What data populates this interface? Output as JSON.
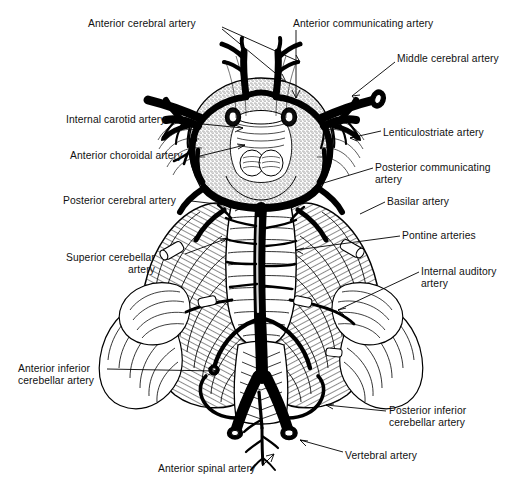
{
  "figure": {
    "background_color": "#ffffff",
    "ink_color": "#000000",
    "style": "black-and-white line engraving / stipple anatomical illustration"
  },
  "labels": [
    {
      "id": "anterior-cerebral-artery",
      "text": "Anterior cerebral artery",
      "text2": "",
      "x": 88,
      "y": 18,
      "align": "left"
    },
    {
      "id": "anterior-communicating-artery",
      "text": "Anterior communicating artery",
      "text2": "",
      "x": 293,
      "y": 18,
      "align": "left"
    },
    {
      "id": "middle-cerebral-artery",
      "text": "Middle cerebral artery",
      "text2": "",
      "x": 397,
      "y": 53,
      "align": "left"
    },
    {
      "id": "internal-carotid-artery",
      "text": "Internal carotid artery",
      "text2": "",
      "x": 66,
      "y": 114,
      "align": "left"
    },
    {
      "id": "lenticulostriate-artery",
      "text": "Lenticulostriate artery",
      "text2": "",
      "x": 383,
      "y": 127,
      "align": "left"
    },
    {
      "id": "anterior-choroidal-artery",
      "text": "Anterior choroidal artery",
      "text2": "",
      "x": 70,
      "y": 150,
      "align": "left"
    },
    {
      "id": "posterior-communicating-artery",
      "text": "Posterior communicating",
      "text2": "artery",
      "x": 375,
      "y": 162,
      "align": "left"
    },
    {
      "id": "posterior-cerebral-artery",
      "text": "Posterior cerebral artery",
      "text2": "",
      "x": 63,
      "y": 195,
      "align": "left"
    },
    {
      "id": "basilar-artery",
      "text": "Basilar artery",
      "text2": "",
      "x": 387,
      "y": 196,
      "align": "left"
    },
    {
      "id": "pontine-arteries",
      "text": "Pontine arteries",
      "text2": "",
      "x": 402,
      "y": 230,
      "align": "left"
    },
    {
      "id": "superior-cerebellar-artery",
      "text": "Superior cerebellar",
      "text2": "artery",
      "x": 66,
      "y": 252,
      "align": "left"
    },
    {
      "id": "internal-auditory-artery",
      "text": "Internal auditory",
      "text2": "artery",
      "x": 421,
      "y": 266,
      "align": "left"
    },
    {
      "id": "anterior-inferior-cerebellar-artery",
      "text": "Anterior inferior",
      "text2": "cerebellar artery",
      "x": 18,
      "y": 363,
      "align": "left"
    },
    {
      "id": "posterior-inferior-cerebellar-artery",
      "text": "Posterior inferior",
      "text2": "cerebellar artery",
      "x": 389,
      "y": 405,
      "align": "left"
    },
    {
      "id": "vertebral-artery",
      "text": "Vertebral artery",
      "text2": "",
      "x": 345,
      "y": 450,
      "align": "left"
    },
    {
      "id": "anterior-spinal-artery",
      "text": "Anterior spinal artery",
      "text2": "",
      "x": 158,
      "y": 463,
      "align": "left"
    }
  ],
  "superior_label_note": "Superior cerebellar artery second line is right-aligned under first line"
}
